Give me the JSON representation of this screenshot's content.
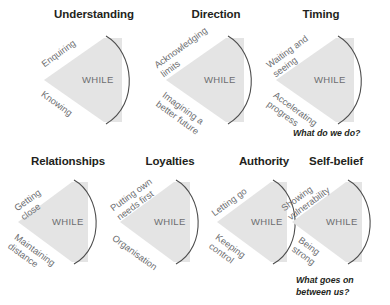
{
  "figure": {
    "fill_color": "#e4e4e4",
    "arc_color": "#4d4d4d",
    "label_color": "#6d6e71",
    "title_color": "#231f20",
    "center_label": "WHILE"
  },
  "rows": [
    {
      "name": "row-top",
      "cells": [
        {
          "id": "understanding",
          "title": "Understanding",
          "center": "WHILE",
          "pole_top": "Enquiring",
          "pole_bottom": "Knowing"
        },
        {
          "id": "direction",
          "title": "Direction",
          "center": "WHILE",
          "pole_top": "Acknowledging\nlimits",
          "pole_bottom": "Imagining a\nbetter future"
        },
        {
          "id": "timing",
          "title": "Timing",
          "center": "WHILE",
          "pole_top": "Waiting and\nseeing",
          "pole_bottom": "Accelerating\nprogress"
        }
      ],
      "caption": "What do we do?"
    },
    {
      "name": "row-bottom",
      "cells": [
        {
          "id": "relationships",
          "title": "Relationships",
          "center": "WHILE",
          "pole_top": "Getting\nclose",
          "pole_bottom": "Maintaining\ndistance"
        },
        {
          "id": "loyalties",
          "title": "Loyalties",
          "center": "WHILE",
          "pole_top": "Putting own\nneeds first",
          "pole_bottom": "Organisation"
        },
        {
          "id": "authority",
          "title": "Authority",
          "center": "WHILE",
          "pole_top": "Letting go",
          "pole_bottom": "Keeping\ncontrol"
        },
        {
          "id": "self-belief",
          "title": "Self-belief",
          "center": "WHILE",
          "pole_top": "Showing\nvulnerability",
          "pole_bottom": "Being\nstrong"
        }
      ],
      "caption": "What goes on\nbetween us?"
    }
  ]
}
